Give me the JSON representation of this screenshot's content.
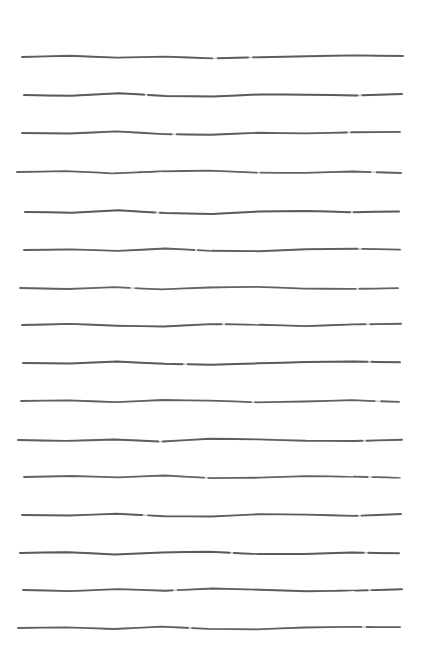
{
  "document": {
    "kind": "scanned-ruled-paper",
    "title": "Ruled Paper Scan",
    "width": 421,
    "height": 665,
    "background_color": "#ffffff",
    "paper_tone": "#ffffff",
    "media": "hand-drawn horizontal rules on white paper",
    "visible_text": "",
    "notes": "No text, labels, numbers, icons or controls are rendered in the image. Only hand-drawn horizontal ruled lines."
  },
  "ruling": {
    "line_count": 16,
    "stroke_color": "#4a4a4a",
    "stroke_color_light": "#8d8d8d",
    "first_line_y": 57,
    "last_line_y": 628,
    "average_spacing": 38,
    "left_margin": 18,
    "right_margin": 404,
    "stroke_width_min": 1.0,
    "stroke_width_max": 2.2,
    "lines": [
      {
        "index": 1,
        "y": 57,
        "x_start": 22,
        "x_end": 403,
        "stroke_width": 1.9,
        "opacity": 0.86,
        "wave": [
          0,
          -1.2,
          0.6,
          -0.4,
          1.4,
          0.2,
          -0.8,
          -1.6,
          -1.0
        ],
        "dashes": "190 6 30 5"
      },
      {
        "index": 2,
        "y": 95,
        "x_start": 24,
        "x_end": 402,
        "stroke_width": 2.0,
        "opacity": 0.88,
        "wave": [
          0,
          0.8,
          -1.8,
          0.9,
          1.6,
          -0.6,
          -0.3,
          0.5,
          -0.9
        ],
        "dashes": "120 4 210 5"
      },
      {
        "index": 3,
        "y": 133,
        "x_start": 22,
        "x_end": 400,
        "stroke_width": 1.9,
        "opacity": 0.85,
        "wave": [
          0,
          0.5,
          -1.6,
          1.1,
          1.8,
          -0.2,
          0.4,
          -0.7,
          -1.1
        ],
        "dashes": "150 5 170 4"
      },
      {
        "index": 4,
        "y": 172,
        "x_start": 17,
        "x_end": 401,
        "stroke_width": 1.8,
        "opacity": 0.83,
        "wave": [
          0,
          -0.9,
          1.3,
          -0.6,
          -1.4,
          0.7,
          0.9,
          -0.5,
          1.0
        ],
        "dashes": "240 4 110 6"
      },
      {
        "index": 5,
        "y": 212,
        "x_start": 25,
        "x_end": 399,
        "stroke_width": 2.0,
        "opacity": 0.87,
        "wave": [
          0,
          0.7,
          -1.7,
          1.0,
          1.9,
          -0.4,
          -1.1,
          0.3,
          -0.6
        ],
        "dashes": "130 5 190 4"
      },
      {
        "index": 6,
        "y": 250,
        "x_start": 24,
        "x_end": 400,
        "stroke_width": 1.9,
        "opacity": 0.84,
        "wave": [
          0,
          -0.6,
          0.9,
          -1.5,
          0.8,
          1.2,
          -0.7,
          -1.3,
          -0.4
        ],
        "dashes": "170 4 160 5"
      },
      {
        "index": 7,
        "y": 288,
        "x_start": 20,
        "x_end": 398,
        "stroke_width": 1.8,
        "opacity": 0.82,
        "wave": [
          0,
          1.0,
          -0.8,
          1.4,
          -0.5,
          -1.2,
          0.6,
          0.9,
          0.2
        ],
        "dashes": "110 6 220 4"
      },
      {
        "index": 8,
        "y": 325,
        "x_start": 22,
        "x_end": 401,
        "stroke_width": 1.9,
        "opacity": 0.86,
        "wave": [
          0,
          -1.1,
          0.7,
          1.5,
          -0.9,
          -0.3,
          1.1,
          -0.6,
          -1.2
        ],
        "dashes": "200 4 140 5"
      },
      {
        "index": 9,
        "y": 363,
        "x_start": 23,
        "x_end": 400,
        "stroke_width": 2.0,
        "opacity": 0.88,
        "wave": [
          0,
          0.6,
          -1.4,
          0.8,
          1.7,
          0.3,
          -1.0,
          -1.5,
          -0.7
        ],
        "dashes": "160 5 180 4"
      },
      {
        "index": 10,
        "y": 401,
        "x_start": 21,
        "x_end": 399,
        "stroke_width": 1.8,
        "opacity": 0.83,
        "wave": [
          0,
          -0.7,
          1.2,
          -1.0,
          -0.4,
          1.3,
          0.5,
          -0.8,
          0.9
        ],
        "dashes": "230 4 120 6"
      },
      {
        "index": 11,
        "y": 440,
        "x_start": 18,
        "x_end": 402,
        "stroke_width": 1.9,
        "opacity": 0.85,
        "wave": [
          0,
          0.9,
          -0.5,
          1.6,
          -1.3,
          -0.6,
          0.8,
          1.0,
          -0.2
        ],
        "dashes": "140 5 200 4"
      },
      {
        "index": 12,
        "y": 477,
        "x_start": 24,
        "x_end": 400,
        "stroke_width": 1.8,
        "opacity": 0.82,
        "wave": [
          0,
          -1.0,
          0.4,
          -1.5,
          1.1,
          0.7,
          -0.9,
          -0.3,
          0.6
        ],
        "dashes": "180 4 160 5"
      },
      {
        "index": 13,
        "y": 515,
        "x_start": 22,
        "x_end": 401,
        "stroke_width": 1.9,
        "opacity": 0.86,
        "wave": [
          0,
          0.5,
          -1.3,
          1.2,
          1.5,
          -0.8,
          -0.4,
          0.9,
          -1.0
        ],
        "dashes": "120 6 210 4"
      },
      {
        "index": 14,
        "y": 553,
        "x_start": 20,
        "x_end": 399,
        "stroke_width": 2.0,
        "opacity": 0.87,
        "wave": [
          0,
          -0.8,
          1.4,
          -0.6,
          -1.2,
          0.9,
          1.0,
          -0.5,
          0.3
        ],
        "dashes": "210 4 130 5"
      },
      {
        "index": 15,
        "y": 590,
        "x_start": 23,
        "x_end": 402,
        "stroke_width": 1.9,
        "opacity": 0.85,
        "wave": [
          0,
          1.1,
          -0.9,
          0.7,
          -1.5,
          -0.3,
          1.2,
          0.6,
          -0.7
        ],
        "dashes": "150 5 190 4"
      },
      {
        "index": 16,
        "y": 628,
        "x_start": 18,
        "x_end": 400,
        "stroke_width": 1.8,
        "opacity": 0.84,
        "wave": [
          0,
          -0.6,
          1.0,
          -1.4,
          0.9,
          1.3,
          -0.5,
          -1.1,
          -0.8
        ],
        "dashes": "170 4 170 5"
      }
    ]
  },
  "margins": {
    "top_blank_height": 57,
    "bottom_blank_height": 37,
    "left_blank_width": 18,
    "right_blank_width": 17
  }
}
